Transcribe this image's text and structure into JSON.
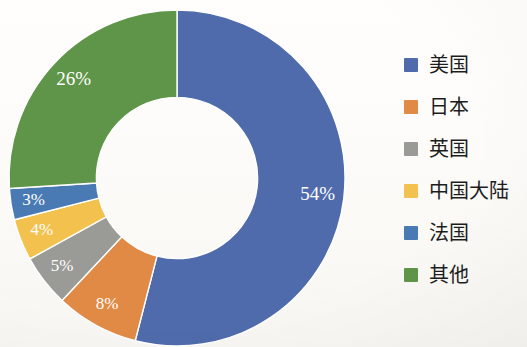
{
  "chart_data": {
    "type": "pie",
    "variant": "donut",
    "title": "",
    "subtitle": "",
    "xlabel": "",
    "ylabel": "",
    "legend_position": "right",
    "grid": false,
    "value_unit": "%",
    "categories": [
      "美国",
      "日本",
      "英国",
      "中国大陆",
      "法国",
      "其他"
    ],
    "values": [
      54,
      8,
      5,
      4,
      3,
      26
    ],
    "data_labels": [
      "54%",
      "8%",
      "5%",
      "4%",
      "3%",
      "26%"
    ],
    "colors": [
      "#4f6bab",
      "#e08a45",
      "#9a9a96",
      "#f2c14e",
      "#4a7ab4",
      "#5f9548"
    ],
    "start_angle_deg": 0,
    "direction": "clockwise",
    "inner_radius_ratio": 0.48
  },
  "legend": {
    "items": [
      {
        "label": "美国",
        "color": "#4f6bab",
        "value": 54
      },
      {
        "label": "日本",
        "color": "#e08a45",
        "value": 8
      },
      {
        "label": "英国",
        "color": "#9a9a96",
        "value": 5
      },
      {
        "label": "中国大陆",
        "color": "#f2c14e",
        "value": 4
      },
      {
        "label": "法国",
        "color": "#4a7ab4",
        "value": 3
      },
      {
        "label": "其他",
        "color": "#5f9548",
        "value": 26
      }
    ]
  },
  "slice_labels": {
    "us": "54%",
    "japan": "8%",
    "uk": "5%",
    "china": "4%",
    "france": "3%",
    "other": "26%"
  }
}
